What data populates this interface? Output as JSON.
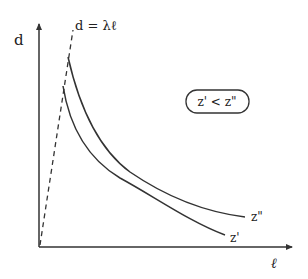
{
  "diagram": {
    "y_axis_label": "d",
    "x_axis_label": "ℓ",
    "line_label": "d = λℓ",
    "condition_box": "z' < z\"",
    "curves": [
      {
        "name": "z''",
        "label": "z\"",
        "note": "starts higher, decays slower, ends higher"
      },
      {
        "name": "z'",
        "label": "z'",
        "note": "starts lower, decays faster, ends lower"
      }
    ],
    "colors": {
      "stroke": "#333333",
      "background": "#ffffff"
    }
  }
}
